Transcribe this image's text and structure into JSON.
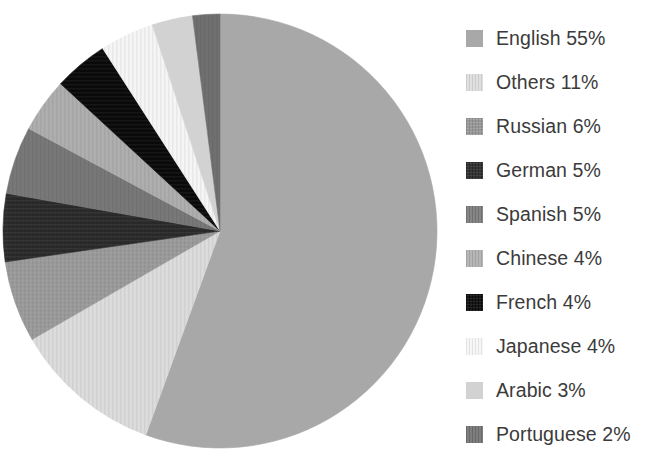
{
  "chart_data": {
    "type": "pie",
    "title": "",
    "subtitle": "",
    "xlabel": "",
    "ylabel": "",
    "grid": false,
    "legend_position": "right",
    "units": "percent",
    "start_angle_deg": 0,
    "direction": "clockwise",
    "categories": [
      "English",
      "Others",
      "Russian",
      "German",
      "Spanish",
      "Chinese",
      "French",
      "Japanese",
      "Arabic",
      "Portuguese"
    ],
    "values": [
      55,
      11,
      6,
      5,
      5,
      4,
      4,
      4,
      3,
      2
    ],
    "slices": [
      {
        "label": "English",
        "value": 55,
        "legend_text": "English 55%",
        "color": "#a8a8a8",
        "pattern": "solid"
      },
      {
        "label": "Others",
        "value": 11,
        "legend_text": "Others 11%",
        "color": "#dcdcdc",
        "pattern": "vertical-stripes"
      },
      {
        "label": "Russian",
        "value": 6,
        "legend_text": "Russian 6%",
        "color": "#9a9a9a",
        "pattern": "crosshatch"
      },
      {
        "label": "German",
        "value": 5,
        "legend_text": "German 5%",
        "color": "#2a2a2a",
        "pattern": "crosshatch"
      },
      {
        "label": "Spanish",
        "value": 5,
        "legend_text": "Spanish 5%",
        "color": "#787878",
        "pattern": "vertical-stripes"
      },
      {
        "label": "Chinese",
        "value": 4,
        "legend_text": "Chinese 4%",
        "color": "#aeaeae",
        "pattern": "vertical-stripes"
      },
      {
        "label": "French",
        "value": 4,
        "legend_text": "French 4%",
        "color": "#0a0a0a",
        "pattern": "crosshatch"
      },
      {
        "label": "Japanese",
        "value": 4,
        "legend_text": "Japanese 4%",
        "color": "#f5f5f5",
        "pattern": "vertical-stripes"
      },
      {
        "label": "Arabic",
        "value": 3,
        "legend_text": "Arabic 3%",
        "color": "#d2d2d2",
        "pattern": "solid"
      },
      {
        "label": "Portuguese",
        "value": 2,
        "legend_text": "Portuguese 2%",
        "color": "#707070",
        "pattern": "vertical-stripes"
      }
    ]
  },
  "geometry": {
    "center_x": 220,
    "center_y": 231,
    "radius": 217
  },
  "style": {
    "background": "#ffffff",
    "legend_text_color": "#3b3b3b"
  }
}
